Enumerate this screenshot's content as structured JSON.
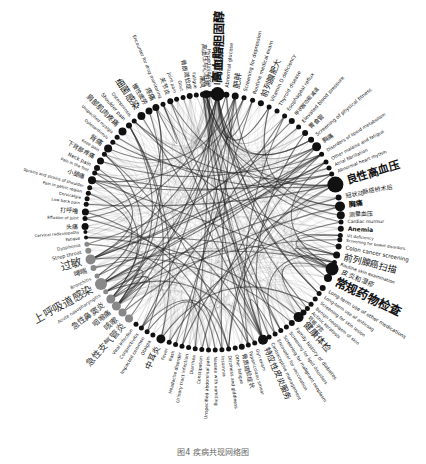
{
  "figure": {
    "type": "circular-network",
    "center": [
      213,
      222
    ],
    "radius": 128,
    "node_color": "#111111",
    "secondary_node_color": "#888888",
    "edge_color": "#222222",
    "caption": "图4 疾病共现网络图"
  },
  "nodes": [
    {
      "label": "高血脂胆固醇",
      "angle": -88,
      "size": 7,
      "font": 12,
      "bold": true
    },
    {
      "label": "高血压与心脏病",
      "angle": -93,
      "size": 4,
      "font": 6
    },
    {
      "label": "Abnormal glucose",
      "angle": -84,
      "size": 3,
      "font": 5
    },
    {
      "label": "肥胖",
      "angle": -80,
      "size": 3.5,
      "font": 8
    },
    {
      "label": "Screening for depression",
      "angle": -76,
      "size": 2.5,
      "font": 5
    },
    {
      "label": "Routine medical exam",
      "angle": -72,
      "size": 2.5,
      "font": 5
    },
    {
      "label": "前列腺肥大",
      "angle": -68,
      "size": 3,
      "font": 8
    },
    {
      "label": "Vitamin D deficiency",
      "angle": -64,
      "size": 2.5,
      "font": 5
    },
    {
      "label": "Thyroid disease",
      "angle": -60,
      "size": 2.5,
      "font": 5
    },
    {
      "label": "Esophageal reflux",
      "angle": -56,
      "size": 2.5,
      "font": 5
    },
    {
      "label": "甲状腺功能减退",
      "angle": -52,
      "size": 3,
      "font": 5
    },
    {
      "label": "Elevated blood pressure",
      "angle": -48,
      "size": 2.5,
      "font": 5
    },
    {
      "label": "胃食管",
      "angle": -44,
      "size": 3,
      "font": 6
    },
    {
      "label": "Screening of physical fitness",
      "angle": -40,
      "size": 3,
      "font": 5
    },
    {
      "label": "胸痛",
      "angle": -36,
      "size": 4.5,
      "font": 6
    },
    {
      "label": "Disorders of lipoid metabolism",
      "angle": -32,
      "size": 2.5,
      "font": 4.5
    },
    {
      "label": "Other malaise and fatigue",
      "angle": -28,
      "size": 2.5,
      "font": 4.5
    },
    {
      "label": "Atrial fibrillation",
      "angle": -25,
      "size": 2.5,
      "font": 4.5
    },
    {
      "label": "Abnormal heart rhythm",
      "angle": -22,
      "size": 2.5,
      "font": 4.5
    },
    {
      "label": "良性高血压",
      "angle": -17,
      "size": 8,
      "font": 11,
      "bold": true
    },
    {
      "label": "冠状动脉搭桥术后",
      "angle": -11,
      "size": 3,
      "font": 6
    },
    {
      "label": "胸痛",
      "angle": -7,
      "size": 5,
      "font": 7,
      "bold": true
    },
    {
      "label": "测量血压",
      "angle": -3,
      "size": 4,
      "font": 6
    },
    {
      "label": "Cardiac murmur",
      "angle": 0,
      "size": 2.5,
      "font": 4.5
    },
    {
      "label": "Anemia",
      "angle": 3,
      "size": 3,
      "font": 6,
      "bold": true
    },
    {
      "label": "Vit deficiency",
      "angle": 6,
      "size": 2.5,
      "font": 4
    },
    {
      "label": "Screening for bowel disorders",
      "angle": 8,
      "size": 2.5,
      "font": 4
    },
    {
      "label": "Colon cancer screening",
      "angle": 11,
      "size": 3,
      "font": 5.5
    },
    {
      "label": "前列腺癌扫描",
      "angle": 15,
      "size": 3.5,
      "font": 9
    },
    {
      "label": "Routine skin examination",
      "angle": 18.5,
      "size": 2.5,
      "font": 4.5
    },
    {
      "label": "皮炎和湿疹",
      "angle": 21.5,
      "size": 6.5,
      "font": 6.5
    },
    {
      "label": "常规药物检查",
      "angle": 26,
      "size": 4,
      "font": 12,
      "bold": true
    },
    {
      "label": "Long-term use of other medications",
      "angle": 31,
      "size": 3,
      "font": 5
    },
    {
      "label": "Long-term use of anticoag",
      "angle": 34,
      "size": 2.5,
      "font": 4.5
    },
    {
      "label": "Screening for skin lesion",
      "angle": 37,
      "size": 2.5,
      "font": 4.5
    },
    {
      "label": "Benign neoplasm of skin",
      "angle": 40,
      "size": 2.5,
      "font": 4.5
    },
    {
      "label": "Actinic keratosis",
      "angle": 42.5,
      "size": 2.5,
      "font": 4.5
    },
    {
      "label": "妊娠子宫",
      "angle": 45,
      "size": 3,
      "font": 5
    },
    {
      "label": "健康体检",
      "angle": 48,
      "size": 5,
      "font": 9
    },
    {
      "label": "Family history of diabetes",
      "angle": 52,
      "size": 3,
      "font": 5
    },
    {
      "label": "Screening for lipid disorders",
      "angle": 55,
      "size": 2.5,
      "font": 4.5
    },
    {
      "label": "Screening for malignant neoplasm",
      "angle": 58,
      "size": 2.5,
      "font": 4.5
    },
    {
      "label": "Encounter for vaccination",
      "angle": 61,
      "size": 2.5,
      "font": 4.5
    },
    {
      "label": "Contraceptive management",
      "angle": 64,
      "size": 2.5,
      "font": 4.5
    },
    {
      "label": "特应性皮炎服务",
      "angle": 67,
      "size": 5,
      "font": 8
    },
    {
      "label": "Gyn exam",
      "angle": 71,
      "size": 2.5,
      "font": 4.5
    },
    {
      "label": "Papanicolaou smear",
      "angle": 74,
      "size": 2.5,
      "font": 4.5
    },
    {
      "label": "骨质疏松症状",
      "angle": 77,
      "size": 3,
      "font": 6
    },
    {
      "label": "Other fatigue",
      "angle": 80,
      "size": 2.5,
      "font": 4.5
    },
    {
      "label": "Dizziness and giddiness",
      "angle": 83,
      "size": 2.5,
      "font": 4.5
    },
    {
      "label": "Insomnia",
      "angle": 86,
      "size": 2.5,
      "font": 4.5
    },
    {
      "label": "Nausea with vomiting",
      "angle": 89,
      "size": 2.5,
      "font": 4.5
    },
    {
      "label": "Unspecified abdominal pain",
      "angle": 92,
      "size": 2.5,
      "font": 4.5
    },
    {
      "label": "Constipation",
      "angle": 95,
      "size": 2.5,
      "font": 4.5
    },
    {
      "label": "Diarrhea",
      "angle": 98,
      "size": 2.5,
      "font": 4.5
    },
    {
      "label": "Urinary tract infection",
      "angle": 101,
      "size": 2.5,
      "font": 4.5
    },
    {
      "label": "Headache disorder",
      "angle": 104,
      "size": 2.5,
      "font": 4.5
    },
    {
      "label": "Rash",
      "angle": 107,
      "size": 2.5,
      "font": 4.5
    },
    {
      "label": "Fever",
      "angle": 110,
      "size": 2.5,
      "font": 4.5
    },
    {
      "label": "中耳炎",
      "angle": 114,
      "size": 4.5,
      "font": 8
    },
    {
      "label": "Otalgia",
      "angle": 118,
      "size": 2.5,
      "font": 4.5
    },
    {
      "label": "Impacted cerumen",
      "angle": 121,
      "size": 2.5,
      "font": 4.5
    },
    {
      "label": "Conjunctivitis",
      "angle": 124,
      "size": 2.5,
      "font": 4.5
    },
    {
      "label": "Viral infection",
      "angle": 127,
      "size": 2.5,
      "font": 4.5
    },
    {
      "label": "急性支气管炎",
      "angle": 131,
      "size": 4,
      "font": 9,
      "grey": true
    },
    {
      "label": "咳嗽",
      "angle": 135,
      "size": 4,
      "font": 8,
      "grey": true
    },
    {
      "label": "咽喉痛",
      "angle": 139,
      "size": 4.5,
      "font": 7,
      "grey": true
    },
    {
      "label": "急性鼻窦炎",
      "angle": 143,
      "size": 4.5,
      "font": 8,
      "grey": true
    },
    {
      "label": "Acute nasopharyngitis",
      "angle": 147,
      "size": 2.5,
      "font": 4.5,
      "grey": true
    },
    {
      "label": "上呼吸道感染",
      "angle": 151,
      "size": 6,
      "font": 11,
      "grey": true
    },
    {
      "label": "Bronchitis",
      "angle": 155,
      "size": 2.5,
      "font": 4.5,
      "grey": true
    },
    {
      "label": "哮喘",
      "angle": 159,
      "size": 3,
      "font": 7,
      "grey": true
    },
    {
      "label": "过敏",
      "angle": 163,
      "size": 5,
      "font": 11,
      "grey": true
    },
    {
      "label": "Strep throat",
      "angle": 167,
      "size": 3,
      "font": 5,
      "grey": true
    },
    {
      "label": "Dysphonia",
      "angle": 170,
      "size": 2.5,
      "font": 4.5,
      "grey": true
    },
    {
      "label": "Fatigue",
      "angle": 173,
      "size": 2,
      "font": 4
    },
    {
      "label": "Cervical radiculopathy",
      "angle": 175.5,
      "size": 2,
      "font": 4
    },
    {
      "label": "头痛",
      "angle": 178,
      "size": 3.5,
      "font": 6
    },
    {
      "label": "Effusion of joint",
      "angle": 181.5,
      "size": 2.5,
      "font": 4
    },
    {
      "label": "打呼噜",
      "angle": 184.5,
      "size": 3.5,
      "font": 6
    },
    {
      "label": "Low back pain",
      "angle": 188,
      "size": 2.5,
      "font": 4
    },
    {
      "label": "Cervicalgia",
      "angle": 190.5,
      "size": 2.5,
      "font": 4
    },
    {
      "label": "Pain in pelvic region",
      "angle": 193,
      "size": 2.5,
      "font": 4
    },
    {
      "label": "Sprains and strains of shoulder",
      "angle": 195.5,
      "size": 2.5,
      "font": 4
    },
    {
      "label": "小腿痛",
      "angle": 199,
      "size": 4,
      "font": 6
    },
    {
      "label": "Pain in the foot",
      "angle": 202.5,
      "size": 2.5,
      "font": 4
    },
    {
      "label": "Neck pain",
      "angle": 205,
      "size": 3,
      "font": 5
    },
    {
      "label": "下背部疼痛",
      "angle": 208.5,
      "size": 3.5,
      "font": 6
    },
    {
      "label": "Knee pain",
      "angle": 212,
      "size": 2.5,
      "font": 4
    },
    {
      "label": "背痛",
      "angle": 215,
      "size": 4,
      "font": 7
    },
    {
      "label": "Osteoarthrosis",
      "angle": 218.5,
      "size": 2.5,
      "font": 4
    },
    {
      "label": "Unspecified myalgia",
      "angle": 221.5,
      "size": 2.5,
      "font": 4
    },
    {
      "label": "肩部肌肉疼痛",
      "angle": 225,
      "size": 4,
      "font": 7
    },
    {
      "label": "Shoulder pain",
      "angle": 229,
      "size": 3,
      "font": 5
    },
    {
      "label": "Osteoporosis",
      "angle": 232,
      "size": 2.5,
      "font": 4.5
    },
    {
      "label": "细菌感染",
      "angle": 236,
      "size": 4,
      "font": 9
    },
    {
      "label": "慢性疲劳",
      "angle": 240,
      "size": 3.5,
      "font": 6
    },
    {
      "label": "疼痛",
      "angle": 243.5,
      "size": 3.5,
      "font": 7
    },
    {
      "label": "Encounter for drug monitoring",
      "angle": 247,
      "size": 2.5,
      "font": 4.5
    },
    {
      "label": "关节炎",
      "angle": 250.5,
      "size": 3,
      "font": 6
    },
    {
      "label": "Joint pain",
      "angle": 253.5,
      "size": 2.5,
      "font": 4.5
    },
    {
      "label": "Gout",
      "angle": 256.5,
      "size": 2.5,
      "font": 4.5
    },
    {
      "label": "骨质疏松症",
      "angle": 259.5,
      "size": 3,
      "font": 6
    },
    {
      "label": "Fatigue",
      "angle": 262.5,
      "size": 2.5,
      "font": 4.5
    },
    {
      "label": "痛风",
      "angle": 265.5,
      "size": 3,
      "font": 6
    },
    {
      "label": "Hyperlipidemia",
      "angle": 268.5,
      "size": 3,
      "font": 5
    },
    {
      "label": "II型糖尿病",
      "angle": 272,
      "size": 5,
      "font": 9
    }
  ]
}
